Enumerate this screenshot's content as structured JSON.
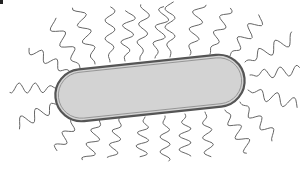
{
  "diagram": {
    "components": [
      {
        "id": "cell-body",
        "shape": "bacillus (rounded rod)"
      },
      {
        "id": "cell-wall",
        "shape": "double outline"
      },
      {
        "id": "flagella",
        "arrangement": "peritrichous"
      }
    ],
    "colors": {
      "body_fill": "#d3d3d3",
      "outline": "#555555",
      "outline_inner": "#8a8a8a",
      "flagella": "#555555",
      "background": "#ffffff"
    },
    "labels": []
  }
}
